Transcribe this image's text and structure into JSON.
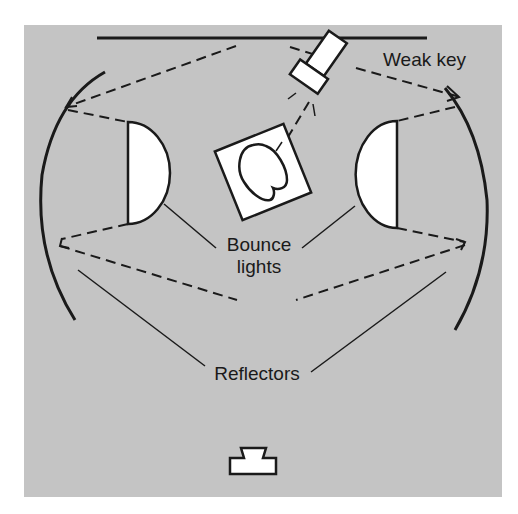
{
  "diagram": {
    "type": "lighting-plan",
    "background_color": "#c4c4c4",
    "line_color": "#1a1a1a",
    "fill_color": "#ffffff",
    "labels": {
      "key_light": "Weak key",
      "bounce_lights_line1": "Bounce",
      "bounce_lights_line2": "lights",
      "reflectors": "Reflectors"
    },
    "elements": [
      {
        "name": "backdrop",
        "shape": "line"
      },
      {
        "name": "weak-key-light",
        "shape": "lamp"
      },
      {
        "name": "subject",
        "shape": "rotated-square-with-head"
      },
      {
        "name": "left-bounce-light",
        "shape": "half-disc"
      },
      {
        "name": "right-bounce-light",
        "shape": "half-disc"
      },
      {
        "name": "left-reflector",
        "shape": "arc"
      },
      {
        "name": "right-reflector",
        "shape": "arc"
      },
      {
        "name": "camera",
        "shape": "camera-symbol"
      }
    ]
  }
}
